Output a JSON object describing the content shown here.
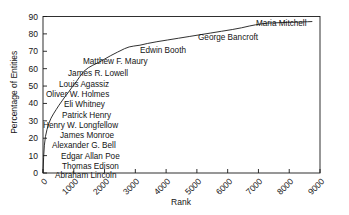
{
  "chart_data": {
    "type": "line",
    "title": "",
    "subtitle": "",
    "xlabel": "Rank",
    "ylabel": "Percentage of Entities",
    "xlim": [
      0,
      9000
    ],
    "ylim": [
      0,
      90
    ],
    "xticks": [
      "0",
      "1000",
      "2000",
      "3000",
      "4000",
      "5000",
      "6000",
      "7000",
      "8000",
      "9000"
    ],
    "xtick_values": [
      0,
      1000,
      2000,
      3000,
      4000,
      5000,
      6000,
      7000,
      8000,
      9000
    ],
    "yticks": [
      "0",
      "10",
      "20",
      "30",
      "40",
      "50",
      "60",
      "70",
      "80",
      "90"
    ],
    "ytick_values": [
      0,
      10,
      20,
      30,
      40,
      50,
      60,
      70,
      80,
      90
    ],
    "grid": false,
    "legend": null,
    "line_color": "#1a1a1a",
    "series": [
      {
        "name": "Cumulative coverage",
        "x": [
          0,
          20,
          45,
          80,
          130,
          190,
          260,
          340,
          430,
          520,
          620,
          720,
          830,
          950,
          1080,
          1200,
          1330,
          1470,
          1620,
          1800,
          2000,
          2200,
          2420,
          2650,
          2800,
          2950,
          3150,
          3400,
          3700,
          4050,
          4400,
          4750,
          5100,
          5450,
          5800,
          6150,
          6450,
          6700,
          6900,
          7100,
          7300,
          7600,
          7950,
          8300,
          8600,
          8750
        ],
        "y": [
          0,
          9,
          16,
          21,
          25,
          28.5,
          31.5,
          34,
          36.5,
          39,
          41.5,
          44,
          46.5,
          49.5,
          52.5,
          55.5,
          58.5,
          60.5,
          62,
          63.5,
          65.5,
          67.5,
          69.5,
          71.5,
          72.5,
          73,
          73.5,
          74.5,
          75.5,
          76.5,
          77.5,
          78.5,
          79.5,
          80.5,
          81.5,
          82.5,
          83.5,
          84.5,
          85.2,
          85.8,
          86.2,
          86.4,
          86.6,
          86.8,
          87,
          87.1
        ]
      }
    ],
    "annotations": [
      {
        "text": "Maria Mitchell",
        "x_px": 256,
        "y_px": 20
      },
      {
        "text": "George Bancroft",
        "x_px": 198,
        "y_px": 34
      },
      {
        "text": "Edwin Booth",
        "x_px": 140,
        "y_px": 47
      },
      {
        "text": "Matthew F. Maury",
        "x_px": 83,
        "y_px": 58
      },
      {
        "text": "James R. Lowell",
        "x_px": 68,
        "y_px": 70
      },
      {
        "text": "Louis Agassiz",
        "x_px": 59,
        "y_px": 81
      },
      {
        "text": "Oliver W. Holmes",
        "x_px": 46,
        "y_px": 91
      },
      {
        "text": "Eli Whitney",
        "x_px": 64,
        "y_px": 101
      },
      {
        "text": "Patrick Henry",
        "x_px": 62,
        "y_px": 112
      },
      {
        "text": "Henry W. Longfellow",
        "x_px": 43,
        "y_px": 122
      },
      {
        "text": "James Monroe",
        "x_px": 60,
        "y_px": 132
      },
      {
        "text": "Alexander G. Bell",
        "x_px": 52,
        "y_px": 142
      },
      {
        "text": "Edgar Allan Poe",
        "x_px": 61,
        "y_px": 153
      },
      {
        "text": "Thomas Edison",
        "x_px": 62,
        "y_px": 163
      },
      {
        "text": "Abraham Lincoln",
        "x_px": 55,
        "y_px": 172
      }
    ]
  }
}
